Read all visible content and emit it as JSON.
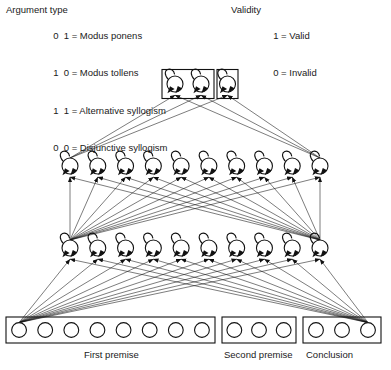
{
  "figure": {
    "type": "neural-network-architecture-diagram"
  },
  "legend_left": {
    "title": "Argument type",
    "rows": [
      {
        "code": "0  1",
        "equals": "=",
        "label": "Modus ponens"
      },
      {
        "code": "1  0",
        "equals": "=",
        "label": "Modus tollens"
      },
      {
        "code": "1  1",
        "equals": "=",
        "label": "Alternative syllogism"
      },
      {
        "code": "0  0",
        "equals": "=",
        "label": "Disjunctive syllogism"
      }
    ]
  },
  "legend_right": {
    "title": "Validity",
    "rows": [
      {
        "code": "1",
        "equals": "=",
        "label": "Valid"
      },
      {
        "code": "0",
        "equals": "=",
        "label": "Invalid"
      }
    ]
  },
  "network": {
    "output_groups": [
      {
        "name": "argument-type-output",
        "units": 2
      },
      {
        "name": "validity-output",
        "units": 1
      }
    ],
    "hidden_layers": [
      {
        "name": "hidden-layer-upper",
        "units": 10,
        "recurrent": true
      },
      {
        "name": "hidden-layer-lower",
        "units": 10,
        "recurrent": true
      }
    ],
    "input_groups": [
      {
        "name": "first-premise",
        "units": 8,
        "label": "First premise"
      },
      {
        "name": "second-premise",
        "units": 3,
        "label": "Second premise"
      },
      {
        "name": "conclusion",
        "units": 3,
        "label": "Conclusion"
      }
    ]
  },
  "input_labels": {
    "first_premise": "First premise",
    "second_premise": "Second premise",
    "conclusion": "Conclusion"
  },
  "colors": {
    "stroke": "#111111",
    "node_fill": "#ffffff",
    "background": "#ffffff",
    "text": "#1a1a1a"
  }
}
